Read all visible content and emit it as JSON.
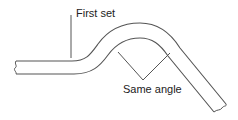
{
  "diagram": {
    "labels": {
      "first_set": "First set",
      "same_angle": "Same angle"
    },
    "colors": {
      "stroke": "#555555",
      "text": "#222222",
      "background": "#ffffff"
    }
  }
}
